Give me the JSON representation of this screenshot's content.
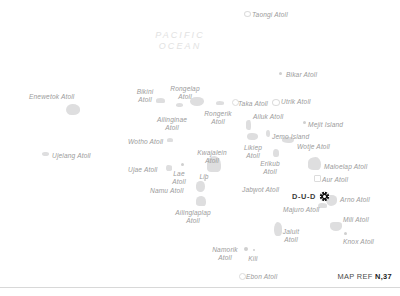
{
  "map": {
    "title": "Marshall Islands Atolls Reference Map",
    "ocean_label": "PACIFIC\nOCEAN",
    "ocean_label_color": "#e2e2e2",
    "label_color": "#9b9b9b",
    "island_color": "#dedede",
    "background_color": "#ffffff",
    "capital": {
      "name": "D-U-D",
      "marker_icon": "capital-star-icon",
      "marker_color": "#1a1a1a",
      "subtitle": "Majuro Atoll"
    },
    "map_reference": {
      "prefix": "MAP REF ",
      "code": "N,37"
    },
    "labels": [
      {
        "name": "Taongi Atoll",
        "text": "Taongi Atoll",
        "x": 252,
        "y": 11,
        "align": "left"
      },
      {
        "name": "Enewetok Atoll",
        "text": "Enewetok Atoll",
        "x": 29,
        "y": 93,
        "align": "left"
      },
      {
        "name": "Bikar Atoll",
        "text": "Bikar Atoll",
        "x": 286,
        "y": 71,
        "align": "left"
      },
      {
        "name": "Bikini Atoll",
        "text": "Bikini\nAtoll",
        "x": 145,
        "y": 88,
        "align": "center"
      },
      {
        "name": "Rongelap Atoll",
        "text": "Rongelap\nAtoll",
        "x": 185,
        "y": 85,
        "align": "center"
      },
      {
        "name": "Rongerik Atoll",
        "text": "Rongerik\nAtoll",
        "x": 218,
        "y": 110,
        "align": "center"
      },
      {
        "name": "Taka Atoll",
        "text": "Taka Atoll",
        "x": 238,
        "y": 100,
        "align": "left"
      },
      {
        "name": "Utrik Atoll",
        "text": "Utrik Atoll",
        "x": 281,
        "y": 98,
        "align": "left"
      },
      {
        "name": "Ailinginae Atoll",
        "text": "Ailinginae\nAtoll",
        "x": 172,
        "y": 116,
        "align": "center"
      },
      {
        "name": "Ailuk Atoll",
        "text": "Ailuk Atoll",
        "x": 253,
        "y": 113,
        "align": "left"
      },
      {
        "name": "Mejit Island",
        "text": "Mejit Island",
        "x": 308,
        "y": 121,
        "align": "left"
      },
      {
        "name": "Jemo Island",
        "text": "Jemo Island",
        "x": 272,
        "y": 133,
        "align": "left"
      },
      {
        "name": "Wotho Atoll",
        "text": "Wotho Atoll",
        "x": 128,
        "y": 138,
        "align": "left"
      },
      {
        "name": "Likiep Atoll",
        "text": "Likiep\nAtoll",
        "x": 253,
        "y": 144,
        "align": "center"
      },
      {
        "name": "Wotje Atoll",
        "text": "Wotje Atoll",
        "x": 297,
        "y": 143,
        "align": "left"
      },
      {
        "name": "Kwajalein Atoll",
        "text": "Kwajalein\nAtoll",
        "x": 212,
        "y": 149,
        "align": "center"
      },
      {
        "name": "Ujelang Atoll",
        "text": "Ujelang Atoll",
        "x": 52,
        "y": 152,
        "align": "left"
      },
      {
        "name": "Erikub Atoll",
        "text": "Erikub\nAtoll",
        "x": 270,
        "y": 160,
        "align": "center"
      },
      {
        "name": "Maloelap Atoll",
        "text": "Maloelap Atoll",
        "x": 324,
        "y": 163,
        "align": "left"
      },
      {
        "name": "Ujae Atoll",
        "text": "Ujae Atoll",
        "x": 128,
        "y": 166,
        "align": "left"
      },
      {
        "name": "Lae Atoll",
        "text": "Lae\nAtoll",
        "x": 179,
        "y": 170,
        "align": "center"
      },
      {
        "name": "Lib",
        "text": "Lib",
        "x": 204,
        "y": 173,
        "align": "center"
      },
      {
        "name": "Aur Atoll",
        "text": "Aur Atoll",
        "x": 322,
        "y": 176,
        "align": "left"
      },
      {
        "name": "Namu Atoll",
        "text": "Namu Atoll",
        "x": 150,
        "y": 187,
        "align": "left"
      },
      {
        "name": "Jabwot Atoll",
        "text": "Jabwot Atoll",
        "x": 242,
        "y": 186,
        "align": "left"
      },
      {
        "name": "Arno Atoll",
        "text": "Arno Atoll",
        "x": 340,
        "y": 196,
        "align": "left"
      },
      {
        "name": "Majuro Atoll",
        "text": "Majuro Atoll",
        "x": 283,
        "y": 206,
        "align": "left"
      },
      {
        "name": "Ailinglaplap Atoll",
        "text": "Ailinglaplap\nAtoll",
        "x": 193,
        "y": 209,
        "align": "center"
      },
      {
        "name": "Mili Atoll",
        "text": "Mili Atoll",
        "x": 343,
        "y": 216,
        "align": "left"
      },
      {
        "name": "Jaluit Atoll",
        "text": "Jaluit\nAtoll",
        "x": 291,
        "y": 228,
        "align": "center"
      },
      {
        "name": "Knox Atoll",
        "text": "Knox Atoll",
        "x": 343,
        "y": 238,
        "align": "left"
      },
      {
        "name": "Namorik Atoll",
        "text": "Namorik\nAtoll",
        "x": 225,
        "y": 246,
        "align": "center"
      },
      {
        "name": "Kili",
        "text": "Kili",
        "x": 253,
        "y": 255,
        "align": "center"
      },
      {
        "name": "Ebon Atoll",
        "text": "Ebon Atoll",
        "x": 246,
        "y": 273,
        "align": "left"
      }
    ],
    "islands": [
      {
        "name": "Taongi Atoll",
        "shape": "ring",
        "x": 244,
        "y": 11,
        "w": 5,
        "h": 4
      },
      {
        "name": "Enewetok Atoll",
        "shape": "blob",
        "x": 66,
        "y": 104,
        "w": 14,
        "h": 11
      },
      {
        "name": "Bikar Atoll",
        "shape": "dot",
        "x": 279,
        "y": 72,
        "w": 3,
        "h": 3
      },
      {
        "name": "Bikini Atoll",
        "shape": "blob",
        "x": 156,
        "y": 98,
        "w": 9,
        "h": 5
      },
      {
        "name": "Rongelap Atoll",
        "shape": "blob",
        "x": 190,
        "y": 97,
        "w": 14,
        "h": 9
      },
      {
        "name": "Rongerik Atoll",
        "shape": "blob",
        "x": 216,
        "y": 101,
        "w": 8,
        "h": 4
      },
      {
        "name": "Taka Atoll",
        "shape": "ring",
        "x": 232,
        "y": 99,
        "w": 5,
        "h": 5
      },
      {
        "name": "Utrik Atoll",
        "shape": "ring",
        "x": 272,
        "y": 99,
        "w": 6,
        "h": 5
      },
      {
        "name": "Ailinginae Atoll",
        "shape": "blob",
        "x": 176,
        "y": 103,
        "w": 7,
        "h": 4
      },
      {
        "name": "Ailuk Atoll",
        "shape": "blob",
        "x": 246,
        "y": 120,
        "w": 5,
        "h": 10
      },
      {
        "name": "Mejit Island",
        "shape": "dot",
        "x": 303,
        "y": 121,
        "w": 3,
        "h": 3
      },
      {
        "name": "Jemo Island",
        "shape": "blob",
        "x": 266,
        "y": 130,
        "w": 4,
        "h": 7
      },
      {
        "name": "Wotho Atoll",
        "shape": "blob",
        "x": 167,
        "y": 138,
        "w": 6,
        "h": 4
      },
      {
        "name": "Likiep Atoll",
        "shape": "blob",
        "x": 247,
        "y": 133,
        "w": 11,
        "h": 7
      },
      {
        "name": "Wotje Atoll",
        "shape": "blob",
        "x": 282,
        "y": 137,
        "w": 12,
        "h": 6
      },
      {
        "name": "Kwajalein Atoll",
        "shape": "blob",
        "x": 207,
        "y": 156,
        "w": 14,
        "h": 16
      },
      {
        "name": "Ujelang Atoll",
        "shape": "blob",
        "x": 42,
        "y": 152,
        "w": 7,
        "h": 4
      },
      {
        "name": "Erikub Atoll",
        "shape": "blob",
        "x": 273,
        "y": 149,
        "w": 6,
        "h": 8
      },
      {
        "name": "Maloelap Atoll",
        "shape": "blob",
        "x": 308,
        "y": 157,
        "w": 13,
        "h": 13
      },
      {
        "name": "Ujae Atoll",
        "shape": "blob",
        "x": 166,
        "y": 165,
        "w": 6,
        "h": 6
      },
      {
        "name": "Lae Atoll",
        "shape": "dot",
        "x": 181,
        "y": 163,
        "w": 3,
        "h": 3
      },
      {
        "name": "Lib",
        "shape": "dot",
        "x": 204,
        "y": 179,
        "w": 2,
        "h": 2
      },
      {
        "name": "Aur Atoll",
        "shape": "sq",
        "x": 314,
        "y": 175,
        "w": 5,
        "h": 5
      },
      {
        "name": "Namu Atoll",
        "shape": "blob",
        "x": 196,
        "y": 181,
        "w": 9,
        "h": 11
      },
      {
        "name": "Jabwot Atoll",
        "shape": "dot",
        "x": 253,
        "y": 192,
        "w": 2,
        "h": 2
      },
      {
        "name": "Arno Atoll",
        "shape": "blob",
        "x": 326,
        "y": 195,
        "w": 11,
        "h": 11
      },
      {
        "name": "Majuro Atoll",
        "shape": "blob",
        "x": 318,
        "y": 203,
        "w": 9,
        "h": 5
      },
      {
        "name": "Ailinglaplap Atoll",
        "shape": "blob",
        "x": 196,
        "y": 196,
        "w": 10,
        "h": 10
      },
      {
        "name": "Mili Atoll",
        "shape": "blob",
        "x": 330,
        "y": 222,
        "w": 12,
        "h": 9
      },
      {
        "name": "Jaluit Atoll",
        "shape": "blob",
        "x": 274,
        "y": 222,
        "w": 8,
        "h": 14
      },
      {
        "name": "Knox Atoll",
        "shape": "dot",
        "x": 344,
        "y": 232,
        "w": 3,
        "h": 3
      },
      {
        "name": "Namorik Atoll",
        "shape": "dot",
        "x": 244,
        "y": 247,
        "w": 4,
        "h": 4
      },
      {
        "name": "Kili",
        "shape": "dot",
        "x": 253,
        "y": 249,
        "w": 2,
        "h": 2
      },
      {
        "name": "Ebon Atoll",
        "shape": "ring",
        "x": 239,
        "y": 273,
        "w": 5,
        "h": 5
      }
    ]
  }
}
